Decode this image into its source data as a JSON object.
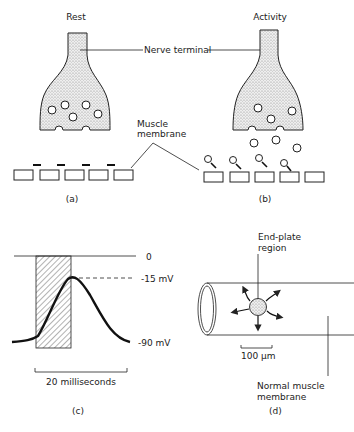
{
  "panels": {
    "a": {
      "title": "Rest",
      "caption": "(a)"
    },
    "b": {
      "title": "Activity",
      "caption": "(b)"
    },
    "c": {
      "caption": "(c)",
      "level_zero": "0",
      "level_peak": "-15 mV",
      "level_rest": "-90 mV",
      "scale_label": "20 milliseconds"
    },
    "d": {
      "caption": "(d)",
      "endplate_label_1": "End-plate",
      "endplate_label_2": "region",
      "scale_label": "100 μm",
      "normal_label_1": "Normal muscle",
      "normal_label_2": "membrane"
    }
  },
  "labels": {
    "nerve_terminal": "Nerve terminal",
    "muscle_membrane_1": "Muscle",
    "muscle_membrane_2": "membrane"
  },
  "colors": {
    "ink": "#222222",
    "stipple": "#bbbbbb",
    "background": "#ffffff"
  }
}
